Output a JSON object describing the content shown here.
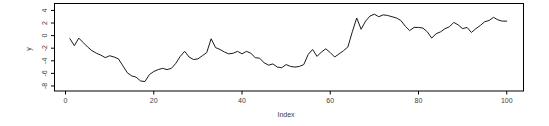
{
  "figure": {
    "background": "#ffffff"
  },
  "chart_data": {
    "type": "line",
    "title": "",
    "xlabel": "Index",
    "ylabel": "y",
    "legend": null,
    "grid": false,
    "box": "full",
    "line_color": "#1a1a1a",
    "frame_color": "#000000",
    "text_color": "#3c3c3c",
    "x_ticks": [
      0,
      20,
      40,
      60,
      80,
      100
    ],
    "y_ticks": [
      4,
      2,
      0,
      -2,
      -4,
      -6,
      -8
    ],
    "xlim": [
      -2.5,
      103.8
    ],
    "ylim": [
      -8.8,
      5.1
    ],
    "x_start": 1,
    "x_step": 1,
    "values": [
      -0.5,
      -1.6,
      -0.4,
      -1.1,
      -1.8,
      -2.4,
      -2.8,
      -3.1,
      -3.5,
      -3.2,
      -3.4,
      -3.7,
      -4.8,
      -5.9,
      -6.4,
      -6.6,
      -7.2,
      -7.3,
      -6.2,
      -5.7,
      -5.4,
      -5.2,
      -5.4,
      -5.2,
      -4.4,
      -3.3,
      -2.5,
      -3.4,
      -3.8,
      -3.7,
      -3.2,
      -2.7,
      -0.5,
      -1.9,
      -2.2,
      -2.6,
      -2.9,
      -2.8,
      -2.5,
      -2.9,
      -2.5,
      -2.8,
      -3.5,
      -3.6,
      -4.3,
      -4.7,
      -4.5,
      -5.0,
      -5.1,
      -4.6,
      -4.9,
      -5.0,
      -4.9,
      -4.6,
      -3.0,
      -2.2,
      -3.3,
      -2.6,
      -2.1,
      -2.7,
      -3.4,
      -2.9,
      -2.4,
      -1.8,
      0.6,
      2.8,
      1.0,
      2.3,
      3.1,
      3.4,
      3.0,
      3.3,
      3.2,
      3.0,
      2.8,
      2.4,
      1.5,
      0.8,
      1.3,
      1.3,
      1.2,
      0.6,
      -0.4,
      0.3,
      0.6,
      1.1,
      1.4,
      2.1,
      1.7,
      1.1,
      1.3,
      0.5,
      1.1,
      1.6,
      2.2,
      2.4,
      2.9,
      2.5,
      2.3,
      2.3
    ]
  }
}
